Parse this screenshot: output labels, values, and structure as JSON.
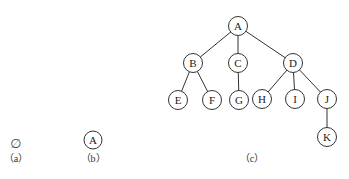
{
  "figure": {
    "panels": [
      {
        "id": "a",
        "caption": "（a）",
        "content": "∅",
        "description": "empty tree"
      },
      {
        "id": "b",
        "caption": "（b）",
        "nodes": [
          {
            "label": "A"
          }
        ],
        "description": "single-node tree"
      },
      {
        "id": "c",
        "caption": "（c）",
        "description": "general tree",
        "nodes": [
          {
            "label": "A",
            "x": 238,
            "y": 26
          },
          {
            "label": "B",
            "x": 193,
            "y": 63
          },
          {
            "label": "C",
            "x": 238,
            "y": 63
          },
          {
            "label": "D",
            "x": 293,
            "y": 63
          },
          {
            "label": "E",
            "x": 178,
            "y": 100
          },
          {
            "label": "F",
            "x": 212,
            "y": 100
          },
          {
            "label": "G",
            "x": 239,
            "y": 100
          },
          {
            "label": "H",
            "x": 262,
            "y": 99
          },
          {
            "label": "I",
            "x": 295,
            "y": 99
          },
          {
            "label": "J",
            "x": 327,
            "y": 99
          },
          {
            "label": "K",
            "x": 327,
            "y": 137
          }
        ],
        "edges": [
          [
            "A",
            "B"
          ],
          [
            "A",
            "C"
          ],
          [
            "A",
            "D"
          ],
          [
            "B",
            "E"
          ],
          [
            "B",
            "F"
          ],
          [
            "C",
            "G"
          ],
          [
            "D",
            "H"
          ],
          [
            "D",
            "I"
          ],
          [
            "D",
            "J"
          ],
          [
            "J",
            "K"
          ]
        ]
      }
    ]
  }
}
